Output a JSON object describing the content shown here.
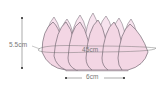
{
  "diagram": {
    "colors": {
      "petal_fill": "#f5dbe8",
      "petal_stroke": "#6e6670",
      "dimension_line": "#555555",
      "label_text": "#777777",
      "background": "#ffffff"
    },
    "dimensions": {
      "height": {
        "label": "5.5cm",
        "orientation": "vertical"
      },
      "circumference": {
        "label": "45cm",
        "orientation": "ellipse"
      },
      "base_width": {
        "label": "6cm",
        "orientation": "horizontal"
      }
    },
    "petal_count_visible": 12
  }
}
